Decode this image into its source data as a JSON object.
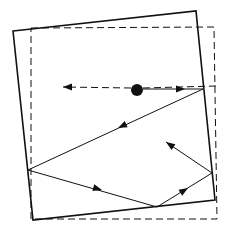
{
  "diagram": {
    "colors": {
      "stroke": "#111111",
      "background": "#ffffff"
    },
    "solid_box": {
      "points": [
        [
          13,
          31
        ],
        [
          196,
          11
        ],
        [
          215,
          200
        ],
        [
          33,
          220
        ]
      ]
    },
    "dashed_box": {
      "points": [
        [
          31,
          28
        ],
        [
          214,
          27
        ],
        [
          217,
          219
        ],
        [
          31,
          219
        ]
      ]
    },
    "ball": {
      "cx": 137,
      "cy": 90,
      "r": 6
    },
    "dashed_ray": {
      "from": [
        131,
        88
      ],
      "to": [
        63,
        87
      ],
      "extend_to": [
        216,
        86
      ]
    },
    "path": [
      [
        143,
        89
      ],
      [
        203,
        89
      ],
      [
        28,
        170
      ],
      [
        157,
        207
      ],
      [
        212,
        173
      ],
      [
        166,
        142
      ]
    ],
    "arrowheads": [
      {
        "at": [
          185,
          89
        ],
        "angle": 0
      },
      {
        "at": [
          118,
          128
        ],
        "angle": 155
      },
      {
        "at": [
          102,
          190
        ],
        "angle": 16
      },
      {
        "at": [
          188,
          188
        ],
        "angle": -32
      },
      {
        "at": [
          166,
          142
        ],
        "angle": 214
      },
      {
        "at": [
          63,
          87
        ],
        "angle": 180
      }
    ]
  }
}
